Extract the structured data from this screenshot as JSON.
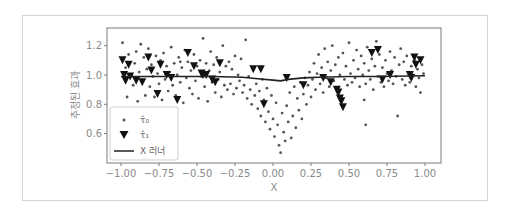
{
  "chart_data": {
    "type": "scatter",
    "title": "",
    "xlabel": "X",
    "ylabel": "추정된 효과",
    "xlim": [
      -1.1,
      1.1
    ],
    "ylim": [
      0.4,
      1.32
    ],
    "xticks": [
      -1.0,
      -0.75,
      -0.5,
      -0.25,
      0.0,
      0.25,
      0.5,
      0.75,
      1.0
    ],
    "xtick_labels": [
      "−1.00",
      "−0.75",
      "−0.50",
      "−0.25",
      "0.00",
      "0.25",
      "0.50",
      "0.75",
      "1.00"
    ],
    "yticks": [
      0.6,
      0.8,
      1.0,
      1.2
    ],
    "ytick_labels": [
      "0.6",
      "0.8",
      "1.0",
      "1.2"
    ],
    "grid": false,
    "legend_position": "lower left",
    "legend": [
      {
        "label": "τ̂₀",
        "marker": "dot",
        "color": "#555555"
      },
      {
        "label": "τ̂₁",
        "marker": "triangle-down",
        "color": "#111111"
      },
      {
        "label": "X 러너",
        "marker": "line",
        "color": "#222222"
      }
    ],
    "series": [
      {
        "name": "τ̂₀",
        "type": "scatter",
        "marker": "dot",
        "points": [
          [
            -0.99,
            1.22
          ],
          [
            -0.97,
            1.05
          ],
          [
            -0.96,
            0.85
          ],
          [
            -0.95,
            1.14
          ],
          [
            -0.93,
            1.0
          ],
          [
            -0.92,
            0.93
          ],
          [
            -0.91,
            1.08
          ],
          [
            -0.9,
            1.16
          ],
          [
            -0.89,
            0.82
          ],
          [
            -0.88,
            1.02
          ],
          [
            -0.87,
            1.21
          ],
          [
            -0.86,
            0.96
          ],
          [
            -0.85,
            1.12
          ],
          [
            -0.84,
            0.86
          ],
          [
            -0.83,
            1.04
          ],
          [
            -0.82,
            1.18
          ],
          [
            -0.81,
            0.92
          ],
          [
            -0.8,
            1.07
          ],
          [
            -0.79,
            0.99
          ],
          [
            -0.78,
            0.85
          ],
          [
            -0.77,
            1.13
          ],
          [
            -0.76,
            1.01
          ],
          [
            -0.75,
            0.94
          ],
          [
            -0.74,
            1.1
          ],
          [
            -0.73,
            0.83
          ],
          [
            -0.72,
            1.15
          ],
          [
            -0.71,
            0.97
          ],
          [
            -0.7,
            1.06
          ],
          [
            -0.69,
            0.89
          ],
          [
            -0.68,
            1.02
          ],
          [
            -0.67,
            1.19
          ],
          [
            -0.66,
            0.93
          ],
          [
            -0.65,
            1.08
          ],
          [
            -0.64,
            0.86
          ],
          [
            -0.63,
            1.0
          ],
          [
            -0.62,
            1.12
          ],
          [
            -0.61,
            0.95
          ],
          [
            -0.6,
            1.05
          ],
          [
            -0.59,
            0.81
          ],
          [
            -0.58,
            1.17
          ],
          [
            -0.57,
            0.98
          ],
          [
            -0.56,
            1.09
          ],
          [
            -0.55,
            0.91
          ],
          [
            -0.54,
            1.03
          ],
          [
            -0.53,
            0.87
          ],
          [
            -0.52,
            1.14
          ],
          [
            -0.51,
            0.96
          ],
          [
            -0.5,
            1.06
          ],
          [
            -0.49,
            0.84
          ],
          [
            -0.48,
            1.1
          ],
          [
            -0.47,
            0.99
          ],
          [
            -0.46,
            1.25
          ],
          [
            -0.45,
            0.92
          ],
          [
            -0.44,
            1.08
          ],
          [
            -0.43,
            0.82
          ],
          [
            -0.42,
            1.03
          ],
          [
            -0.41,
            1.16
          ],
          [
            -0.4,
            0.95
          ],
          [
            -0.39,
            1.07
          ],
          [
            -0.38,
            0.88
          ],
          [
            -0.37,
            1.12
          ],
          [
            -0.36,
            0.97
          ],
          [
            -0.35,
            1.02
          ],
          [
            -0.34,
            0.85
          ],
          [
            -0.33,
            1.2
          ],
          [
            -0.32,
            0.93
          ],
          [
            -0.31,
            1.06
          ],
          [
            -0.3,
            0.9
          ],
          [
            -0.29,
            1.09
          ],
          [
            -0.28,
            0.94
          ],
          [
            -0.27,
            1.04
          ],
          [
            -0.26,
            0.87
          ],
          [
            -0.25,
            1.13
          ],
          [
            -0.24,
            0.91
          ],
          [
            -0.23,
            1.0
          ],
          [
            -0.22,
            0.96
          ],
          [
            -0.21,
            1.11
          ],
          [
            -0.2,
            0.88
          ],
          [
            -0.19,
            0.93
          ],
          [
            -0.18,
            1.24
          ],
          [
            -0.17,
            0.84
          ],
          [
            -0.16,
            0.99
          ],
          [
            -0.15,
            0.9
          ],
          [
            -0.14,
            0.8
          ],
          [
            -0.13,
            1.05
          ],
          [
            -0.12,
            0.86
          ],
          [
            -0.11,
            0.94
          ],
          [
            -0.1,
            0.77
          ],
          [
            -0.09,
            0.89
          ],
          [
            -0.08,
            0.72
          ],
          [
            -0.07,
            0.97
          ],
          [
            -0.06,
            0.83
          ],
          [
            -0.05,
            0.68
          ],
          [
            -0.04,
            0.91
          ],
          [
            -0.03,
            0.75
          ],
          [
            -0.02,
            0.63
          ],
          [
            -0.01,
            0.86
          ],
          [
            0.0,
            0.7
          ],
          [
            0.01,
            0.58
          ],
          [
            0.02,
            0.81
          ],
          [
            0.03,
            0.66
          ],
          [
            0.04,
            0.52
          ],
          [
            0.05,
            0.47
          ],
          [
            0.06,
            0.74
          ],
          [
            0.07,
            0.61
          ],
          [
            0.08,
            0.55
          ],
          [
            0.09,
            0.79
          ],
          [
            0.1,
            0.68
          ],
          [
            0.11,
            0.88
          ],
          [
            0.12,
            0.57
          ],
          [
            0.13,
            0.72
          ],
          [
            0.14,
            0.92
          ],
          [
            0.15,
            0.64
          ],
          [
            0.16,
            0.84
          ],
          [
            0.17,
            0.76
          ],
          [
            0.18,
            0.95
          ],
          [
            0.19,
            0.7
          ],
          [
            0.2,
            0.87
          ],
          [
            0.21,
            0.98
          ],
          [
            0.22,
            0.8
          ],
          [
            0.23,
            0.93
          ],
          [
            0.24,
            1.02
          ],
          [
            0.25,
            0.85
          ],
          [
            0.26,
            0.97
          ],
          [
            0.27,
            1.08
          ],
          [
            0.28,
            0.9
          ],
          [
            0.29,
            1.01
          ],
          [
            0.3,
            1.14
          ],
          [
            0.31,
            0.94
          ],
          [
            0.32,
            1.05
          ],
          [
            0.33,
            0.88
          ],
          [
            0.34,
            1.18
          ],
          [
            0.35,
            0.98
          ],
          [
            0.36,
            1.09
          ],
          [
            0.37,
            0.92
          ],
          [
            0.38,
            1.03
          ],
          [
            0.39,
            1.2
          ],
          [
            0.4,
            0.96
          ],
          [
            0.41,
            1.07
          ],
          [
            0.42,
            0.9
          ],
          [
            0.43,
            1.12
          ],
          [
            0.44,
            1.0
          ],
          [
            0.45,
            0.85
          ],
          [
            0.46,
            1.15
          ],
          [
            0.47,
            0.97
          ],
          [
            0.48,
            1.06
          ],
          [
            0.49,
            0.93
          ],
          [
            0.5,
            1.22
          ],
          [
            0.51,
            1.01
          ],
          [
            0.52,
            0.95
          ],
          [
            0.53,
            1.1
          ],
          [
            0.54,
            0.98
          ],
          [
            0.55,
            1.17
          ],
          [
            0.56,
            1.04
          ],
          [
            0.57,
            0.92
          ],
          [
            0.58,
            1.13
          ],
          [
            0.59,
            1.0
          ],
          [
            0.6,
            1.08
          ],
          [
            0.61,
            0.94
          ],
          [
            0.62,
            1.19
          ],
          [
            0.63,
            1.03
          ],
          [
            0.64,
            0.97
          ],
          [
            0.65,
            1.11
          ],
          [
            0.66,
            0.9
          ],
          [
            0.67,
            1.06
          ],
          [
            0.68,
            1.23
          ],
          [
            0.69,
            0.99
          ],
          [
            0.7,
            1.14
          ],
          [
            0.71,
            0.95
          ],
          [
            0.72,
            1.05
          ],
          [
            0.73,
            0.92
          ],
          [
            0.74,
            1.1
          ],
          [
            0.75,
            1.01
          ],
          [
            0.76,
            0.96
          ],
          [
            0.77,
            1.16
          ],
          [
            0.78,
            1.03
          ],
          [
            0.79,
            0.94
          ],
          [
            0.8,
            1.12
          ],
          [
            0.81,
            0.99
          ],
          [
            0.82,
            0.72
          ],
          [
            0.83,
            1.07
          ],
          [
            0.84,
            1.18
          ],
          [
            0.85,
            0.97
          ],
          [
            0.86,
            1.09
          ],
          [
            0.87,
            0.93
          ],
          [
            0.88,
            1.13
          ],
          [
            0.89,
            1.02
          ],
          [
            0.9,
            0.95
          ],
          [
            0.91,
            1.06
          ],
          [
            0.92,
            1.0
          ],
          [
            0.93,
            1.1
          ],
          [
            0.94,
            0.92
          ],
          [
            0.95,
            1.04
          ],
          [
            0.96,
            0.98
          ],
          [
            0.97,
            0.88
          ],
          [
            0.98,
            1.07
          ],
          [
            0.99,
            1.01
          ],
          [
            0.61,
            0.66
          ],
          [
            0.6,
            0.83
          ],
          [
            -0.61,
            1.09
          ]
        ]
      },
      {
        "name": "τ̂₁",
        "type": "scatter",
        "marker": "triangle-down",
        "points": [
          [
            -0.99,
            1.1
          ],
          [
            -0.98,
            1.0
          ],
          [
            -0.97,
            0.96
          ],
          [
            -0.95,
            1.07
          ],
          [
            -0.94,
            0.99
          ],
          [
            -0.9,
            0.96
          ],
          [
            -0.86,
            0.95
          ],
          [
            -0.82,
            1.12
          ],
          [
            -0.8,
            1.03
          ],
          [
            -0.76,
            0.87
          ],
          [
            -0.74,
            1.07
          ],
          [
            -0.7,
            1.0
          ],
          [
            -0.67,
            0.98
          ],
          [
            -0.63,
            0.83
          ],
          [
            -0.56,
            1.15
          ],
          [
            -0.52,
            1.06
          ],
          [
            -0.47,
            1.01
          ],
          [
            -0.46,
            1.0
          ],
          [
            -0.44,
            1.0
          ],
          [
            -0.4,
            0.97
          ],
          [
            -0.38,
            0.95
          ],
          [
            -0.35,
            1.08
          ],
          [
            -0.13,
            1.04
          ],
          [
            -0.08,
            1.04
          ],
          [
            -0.06,
            0.8
          ],
          [
            0.09,
            0.98
          ],
          [
            0.2,
            0.93
          ],
          [
            0.33,
            0.98
          ],
          [
            0.38,
            0.95
          ],
          [
            0.42,
            0.9
          ],
          [
            0.43,
            0.88
          ],
          [
            0.44,
            0.84
          ],
          [
            0.45,
            0.82
          ],
          [
            0.46,
            0.78
          ],
          [
            0.65,
            1.15
          ],
          [
            0.69,
            1.17
          ],
          [
            0.72,
            0.97
          ],
          [
            0.77,
            1.0
          ],
          [
            0.9,
            1.0
          ],
          [
            0.91,
            0.98
          ],
          [
            0.93,
            1.12
          ],
          [
            0.94,
            1.07
          ],
          [
            0.97,
            1.1
          ]
        ]
      },
      {
        "name": "X 러너",
        "type": "line",
        "points": [
          [
            -1.0,
            0.99
          ],
          [
            -0.8,
            0.99
          ],
          [
            -0.6,
            0.99
          ],
          [
            -0.4,
            0.99
          ],
          [
            -0.2,
            0.985
          ],
          [
            -0.1,
            0.975
          ],
          [
            0.0,
            0.965
          ],
          [
            0.05,
            0.96
          ],
          [
            0.1,
            0.97
          ],
          [
            0.2,
            0.98
          ],
          [
            0.3,
            0.985
          ],
          [
            0.5,
            0.99
          ],
          [
            0.7,
            0.99
          ],
          [
            1.0,
            0.995
          ]
        ]
      }
    ]
  },
  "colors": {
    "frame": "#d4d4d4",
    "axes": "#7a7a7a",
    "dot": "#555555",
    "triangle": "#111111",
    "line": "#222222",
    "tick_text": "#8a8a8a"
  }
}
